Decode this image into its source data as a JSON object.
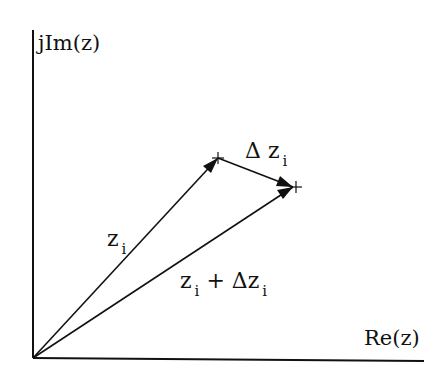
{
  "axes": {
    "y_label": "jIm(z)",
    "x_label": "Re(z)"
  },
  "vectors": [
    {
      "name": "z_i",
      "label_main": "z",
      "label_sub": "i",
      "from": [
        33,
        358
      ],
      "to": [
        218,
        158
      ]
    },
    {
      "name": "delta_z_i",
      "label_main": "Δ z",
      "label_sub": "i",
      "from": [
        218,
        158
      ],
      "to": [
        293,
        187
      ]
    },
    {
      "name": "z_i_plus_delta_z_i",
      "label_main": "z",
      "label_sub": "i",
      "label_tail": " + Δz",
      "label_tail_sub": "i",
      "from": [
        33,
        358
      ],
      "to": [
        293,
        187
      ]
    }
  ],
  "colors": {
    "ink": "#111111",
    "background": "#ffffff"
  }
}
